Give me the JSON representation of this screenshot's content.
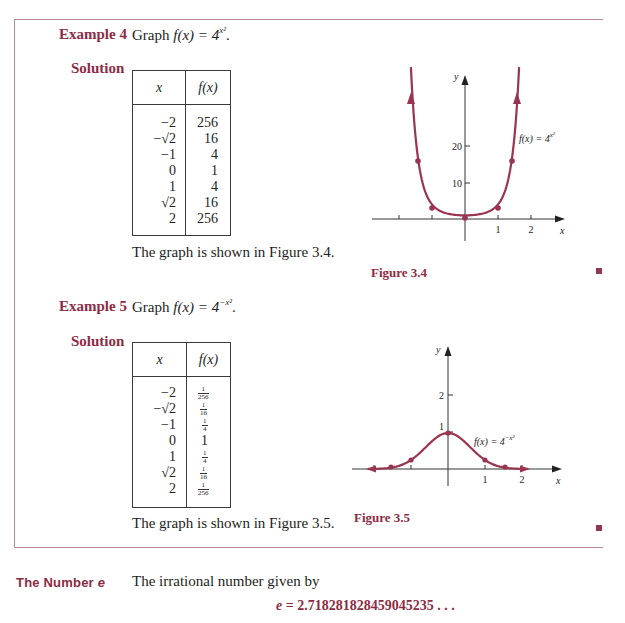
{
  "colors": {
    "accent": "#8c2c44",
    "curve": "#9a3550",
    "frame": "#b58a95",
    "text": "#1e1e1e"
  },
  "example4": {
    "label": "Example 4",
    "prompt_prefix": "Graph ",
    "function": "f(x) = 4",
    "exponent": "x²",
    "period": ".",
    "solution_label": "Solution",
    "table": {
      "headers": [
        "x",
        "f(x)"
      ],
      "rows": [
        {
          "x": "−2",
          "f": "256"
        },
        {
          "x": "−√2",
          "f": "16"
        },
        {
          "x": "−1",
          "f": "4"
        },
        {
          "x": "0",
          "f": "1"
        },
        {
          "x": "1",
          "f": "4"
        },
        {
          "x": "√2",
          "f": "16"
        },
        {
          "x": "2",
          "f": "256"
        }
      ]
    },
    "note": "The graph is shown in Figure 3.4.",
    "figure_caption": "Figure 3.4",
    "graph_label": "f(x) = 4",
    "graph_label_exp": "x²"
  },
  "example5": {
    "label": "Example 5",
    "prompt_prefix": "Graph ",
    "function": "f(x) = 4",
    "exponent": "−x²",
    "period": ".",
    "solution_label": "Solution",
    "table": {
      "headers": [
        "x",
        "f(x)"
      ],
      "rows": [
        {
          "x": "−2",
          "f_num": "1",
          "f_den": "256"
        },
        {
          "x": "−√2",
          "f_num": "1",
          "f_den": "16"
        },
        {
          "x": "−1",
          "f_num": "1",
          "f_den": "4"
        },
        {
          "x": "0",
          "f": "1"
        },
        {
          "x": "1",
          "f_num": "1",
          "f_den": "4"
        },
        {
          "x": "√2",
          "f_num": "1",
          "f_den": "16"
        },
        {
          "x": "2",
          "f_num": "1",
          "f_den": "256"
        }
      ]
    },
    "note": "The graph is shown in Figure 3.5.",
    "figure_caption": "Figure 3.5",
    "graph_label": "f(x) = 4",
    "graph_label_exp": "−x²"
  },
  "number_e": {
    "heading": "The Number e",
    "heading_prefix": "The Number ",
    "heading_var": "e",
    "text": "The irrational number given by",
    "equation_var": "e",
    "equation_value": " = 2.718281828459045235 . . ."
  },
  "chart_data": [
    {
      "type": "line",
      "title": "Figure 3.4",
      "function": "f(x) = 4^(x^2)",
      "annotation": "f(x) = 4^(x²)",
      "xlabel": "x",
      "ylabel": "y",
      "x_ticks": [
        "1",
        "2"
      ],
      "y_ticks": [
        "10",
        "20"
      ],
      "xlim": [
        -2.2,
        2.3
      ],
      "ylim": [
        -2,
        38
      ],
      "grid": false,
      "points": [
        {
          "x": -1.414,
          "y": 16
        },
        {
          "x": -1,
          "y": 4
        },
        {
          "x": 0,
          "y": 1
        },
        {
          "x": 1,
          "y": 4
        },
        {
          "x": 1.414,
          "y": 16
        }
      ],
      "labels": {
        "x_axis": "x",
        "y_axis": "y",
        "tick_1": "1",
        "tick_2": "2",
        "ytick_10": "10",
        "ytick_20": "20"
      }
    },
    {
      "type": "line",
      "title": "Figure 3.5",
      "function": "f(x) = 4^(-x^2)",
      "annotation": "f(x) = 4^(−x²)",
      "xlabel": "x",
      "ylabel": "y",
      "x_ticks": [
        "1",
        "2"
      ],
      "y_ticks": [
        "1",
        "2"
      ],
      "xlim": [
        -2.2,
        2.5
      ],
      "ylim": [
        -0.2,
        3
      ],
      "grid": false,
      "points": [
        {
          "x": -2,
          "y": 0.0039
        },
        {
          "x": -1.414,
          "y": 0.0625
        },
        {
          "x": -1,
          "y": 0.25
        },
        {
          "x": 0,
          "y": 1
        },
        {
          "x": 1,
          "y": 0.25
        },
        {
          "x": 1.414,
          "y": 0.0625
        },
        {
          "x": 2,
          "y": 0.0039
        }
      ],
      "labels": {
        "x_axis": "x",
        "y_axis": "y",
        "tick_1": "1",
        "tick_2": "2",
        "ytick_1": "1",
        "ytick_2": "2"
      }
    }
  ]
}
